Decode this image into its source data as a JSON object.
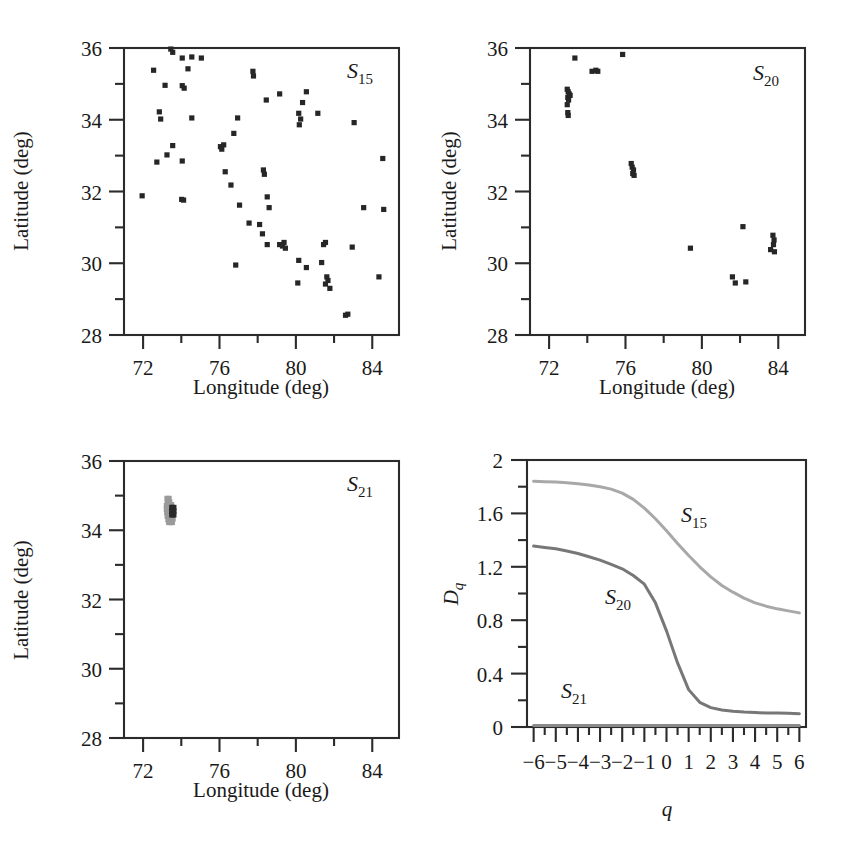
{
  "figure": {
    "panels": [
      "S15-map",
      "S20-map",
      "S21-map",
      "Dq-curves"
    ]
  },
  "maps": {
    "xlabel": "Longitude (deg)",
    "ylabel": "Latitude (deg)",
    "xlim": [
      71.0,
      85.4
    ],
    "ylim": [
      28.0,
      36.0
    ],
    "xmajor": [
      72,
      76,
      80,
      84
    ],
    "xminor": [
      74,
      78,
      82
    ],
    "ymajor": [
      28,
      30,
      32,
      34,
      36
    ],
    "yminor": [
      29,
      31,
      33,
      35
    ],
    "xmajor_labels": [
      "72",
      "76",
      "80",
      "84"
    ],
    "ymajor_labels": [
      "28",
      "30",
      "32",
      "34",
      "36"
    ]
  },
  "panel_s15": {
    "label_base": "S",
    "label_sub": "15",
    "name": "S15"
  },
  "panel_s20": {
    "label_base": "S",
    "label_sub": "20",
    "name": "S20"
  },
  "panel_s21": {
    "label_base": "S",
    "label_sub": "21",
    "name": "S21"
  },
  "panel_dq": {
    "label_s15_base": "S",
    "label_s15_sub": "15",
    "label_s20_base": "S",
    "label_s20_sub": "20",
    "label_s21_base": "S",
    "label_s21_sub": "21"
  },
  "chart_data": [
    {
      "type": "scatter",
      "title": "S15",
      "xlabel": "Longitude (deg)",
      "ylabel": "Latitude (deg)",
      "xlim": [
        71.0,
        85.4
      ],
      "ylim": [
        28.0,
        36.0
      ],
      "grid": false,
      "marker": "square",
      "color": "#262626",
      "points": [
        [
          73.45,
          35.97
        ],
        [
          73.55,
          35.88
        ],
        [
          74.05,
          35.72
        ],
        [
          74.55,
          35.75
        ],
        [
          75.05,
          35.72
        ],
        [
          72.55,
          35.38
        ],
        [
          74.35,
          35.42
        ],
        [
          77.75,
          35.35
        ],
        [
          77.78,
          35.22
        ],
        [
          73.15,
          34.96
        ],
        [
          74.05,
          34.95
        ],
        [
          74.15,
          34.88
        ],
        [
          79.15,
          34.72
        ],
        [
          80.55,
          34.78
        ],
        [
          78.45,
          34.55
        ],
        [
          80.35,
          34.48
        ],
        [
          72.85,
          34.22
        ],
        [
          72.92,
          34.02
        ],
        [
          74.55,
          34.05
        ],
        [
          76.95,
          34.05
        ],
        [
          80.15,
          34.18
        ],
        [
          80.25,
          34.02
        ],
        [
          80.18,
          33.86
        ],
        [
          81.15,
          34.18
        ],
        [
          83.05,
          33.92
        ],
        [
          76.75,
          33.62
        ],
        [
          73.55,
          33.28
        ],
        [
          76.05,
          33.25
        ],
        [
          76.12,
          33.18
        ],
        [
          76.22,
          33.3
        ],
        [
          73.25,
          33.02
        ],
        [
          72.72,
          32.82
        ],
        [
          74.05,
          32.85
        ],
        [
          84.55,
          32.92
        ],
        [
          76.3,
          32.55
        ],
        [
          78.3,
          32.6
        ],
        [
          78.35,
          32.48
        ],
        [
          76.6,
          32.18
        ],
        [
          71.95,
          31.88
        ],
        [
          74.02,
          31.78
        ],
        [
          74.12,
          31.76
        ],
        [
          78.5,
          31.85
        ],
        [
          77.05,
          31.62
        ],
        [
          78.6,
          31.55
        ],
        [
          83.55,
          31.55
        ],
        [
          84.6,
          31.5
        ],
        [
          77.55,
          31.12
        ],
        [
          78.1,
          31.08
        ],
        [
          78.25,
          30.82
        ],
        [
          78.5,
          30.52
        ],
        [
          79.15,
          30.52
        ],
        [
          79.3,
          30.48
        ],
        [
          79.45,
          30.42
        ],
        [
          79.38,
          30.58
        ],
        [
          81.45,
          30.52
        ],
        [
          81.55,
          30.58
        ],
        [
          82.95,
          30.45
        ],
        [
          76.85,
          29.95
        ],
        [
          80.15,
          30.08
        ],
        [
          80.55,
          29.88
        ],
        [
          81.35,
          30.02
        ],
        [
          80.1,
          29.45
        ],
        [
          81.62,
          29.62
        ],
        [
          81.68,
          29.52
        ],
        [
          81.55,
          29.42
        ],
        [
          81.78,
          29.3
        ],
        [
          84.35,
          29.62
        ],
        [
          82.6,
          28.55
        ],
        [
          82.72,
          28.58
        ]
      ]
    },
    {
      "type": "scatter",
      "title": "S20",
      "xlabel": "Longitude (deg)",
      "ylabel": "Latitude (deg)",
      "xlim": [
        71.0,
        85.4
      ],
      "ylim": [
        28.0,
        36.0
      ],
      "grid": false,
      "marker": "square",
      "color": "#262626",
      "points": [
        [
          73.35,
          35.72
        ],
        [
          75.85,
          35.82
        ],
        [
          74.25,
          35.35
        ],
        [
          74.45,
          35.38
        ],
        [
          74.55,
          35.35
        ],
        [
          72.95,
          34.85
        ],
        [
          73.0,
          34.78
        ],
        [
          73.05,
          34.72
        ],
        [
          73.1,
          34.68
        ],
        [
          72.98,
          34.62
        ],
        [
          73.02,
          34.55
        ],
        [
          72.95,
          34.42
        ],
        [
          72.98,
          34.2
        ],
        [
          73.0,
          34.12
        ],
        [
          76.3,
          32.78
        ],
        [
          76.35,
          32.68
        ],
        [
          76.42,
          32.6
        ],
        [
          76.38,
          32.5
        ],
        [
          76.45,
          32.45
        ],
        [
          82.15,
          31.02
        ],
        [
          83.72,
          30.78
        ],
        [
          83.78,
          30.65
        ],
        [
          83.75,
          30.52
        ],
        [
          83.6,
          30.38
        ],
        [
          83.8,
          30.32
        ],
        [
          79.4,
          30.42
        ],
        [
          81.6,
          29.62
        ],
        [
          81.75,
          29.45
        ],
        [
          82.3,
          29.48
        ]
      ]
    },
    {
      "type": "scatter",
      "title": "S21",
      "xlabel": "Longitude (deg)",
      "ylabel": "Latitude (deg)",
      "xlim": [
        71.0,
        85.4
      ],
      "ylim": [
        28.0,
        36.0
      ],
      "grid": false,
      "marker": "square",
      "cluster_center": [
        73.45,
        34.5
      ],
      "cluster_colors": [
        "#9a9a9a",
        "#2a2a2a"
      ],
      "points_gray": [
        [
          73.25,
          34.92
        ],
        [
          73.33,
          34.92
        ],
        [
          73.28,
          34.82
        ],
        [
          73.36,
          34.82
        ],
        [
          73.22,
          34.72
        ],
        [
          73.3,
          34.72
        ],
        [
          73.38,
          34.72
        ],
        [
          73.46,
          34.74
        ],
        [
          73.22,
          34.62
        ],
        [
          73.3,
          34.62
        ],
        [
          73.38,
          34.62
        ],
        [
          73.24,
          34.52
        ],
        [
          73.32,
          34.52
        ],
        [
          73.4,
          34.52
        ],
        [
          73.26,
          34.42
        ],
        [
          73.34,
          34.42
        ],
        [
          73.42,
          34.42
        ],
        [
          73.5,
          34.44
        ],
        [
          73.3,
          34.32
        ],
        [
          73.38,
          34.32
        ],
        [
          73.46,
          34.32
        ],
        [
          73.54,
          34.34
        ],
        [
          73.34,
          34.24
        ],
        [
          73.42,
          34.24
        ],
        [
          73.5,
          34.24
        ]
      ],
      "points_dark": [
        [
          73.5,
          34.66
        ],
        [
          73.58,
          34.66
        ],
        [
          73.5,
          34.56
        ],
        [
          73.58,
          34.56
        ],
        [
          73.5,
          34.46
        ],
        [
          73.58,
          34.46
        ]
      ]
    },
    {
      "type": "line",
      "title": "",
      "xlabel": "q",
      "ylabel": "Dq",
      "xlim": [
        -6.3,
        6.3
      ],
      "ylim": [
        0,
        2
      ],
      "grid": false,
      "xmajor": [
        -6,
        -5,
        -4,
        -3,
        -2,
        -1,
        0,
        1,
        2,
        3,
        4,
        5,
        6
      ],
      "xmajor_labels": [
        "−6",
        "−5",
        "−4",
        "−3",
        "−2",
        "−1",
        "0",
        "1",
        "2",
        "3",
        "4",
        "5",
        "6"
      ],
      "ymajor": [
        0,
        0.4,
        0.8,
        1.2,
        1.6,
        2
      ],
      "ymajor_labels": [
        "0",
        "0.4",
        "0.8",
        "1.2",
        "1.6",
        "2"
      ],
      "yminor": [
        0.2,
        0.6,
        1.0,
        1.4,
        1.8
      ],
      "x": [
        -6,
        -5.5,
        -5,
        -4.5,
        -4,
        -3.5,
        -3,
        -2.5,
        -2,
        -1.5,
        -1,
        -0.5,
        0,
        0.5,
        1,
        1.5,
        2,
        2.5,
        3,
        3.5,
        4,
        4.5,
        5,
        5.5,
        6
      ],
      "series": [
        {
          "name": "S15",
          "color": "#a8a8a8",
          "values": [
            1.84,
            1.838,
            1.835,
            1.83,
            1.822,
            1.812,
            1.8,
            1.782,
            1.752,
            1.705,
            1.64,
            1.56,
            1.47,
            1.375,
            1.285,
            1.2,
            1.125,
            1.06,
            1.01,
            0.965,
            0.93,
            0.905,
            0.885,
            0.87,
            0.855
          ]
        },
        {
          "name": "S20",
          "color": "#777777",
          "values": [
            1.355,
            1.345,
            1.335,
            1.318,
            1.3,
            1.275,
            1.25,
            1.218,
            1.185,
            1.135,
            1.07,
            0.93,
            0.72,
            0.48,
            0.28,
            0.185,
            0.145,
            0.128,
            0.118,
            0.112,
            0.108,
            0.105,
            0.105,
            0.103,
            0.1
          ]
        },
        {
          "name": "S21",
          "color": "#8a8a8a",
          "values": [
            0.012,
            0.012,
            0.012,
            0.012,
            0.012,
            0.012,
            0.012,
            0.012,
            0.012,
            0.012,
            0.012,
            0.012,
            0.012,
            0.012,
            0.012,
            0.012,
            0.012,
            0.012,
            0.012,
            0.012,
            0.012,
            0.012,
            0.012,
            0.012,
            0.012
          ]
        }
      ]
    }
  ]
}
